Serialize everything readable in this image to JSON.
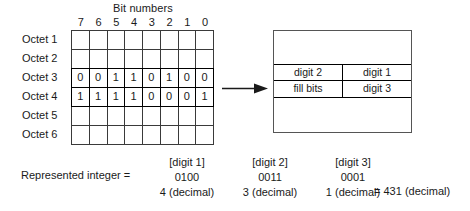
{
  "figure": {
    "bit_numbers": {
      "title": "Bit numbers",
      "labels": [
        "7",
        "6",
        "5",
        "4",
        "3",
        "2",
        "1",
        "0"
      ]
    },
    "octet_rows": [
      {
        "label": "Octet 1",
        "highlight": false,
        "bits": [
          "",
          "",
          "",
          "",
          "",
          "",
          "",
          ""
        ]
      },
      {
        "label": "Octet 2",
        "highlight": false,
        "bits": [
          "",
          "",
          "",
          "",
          "",
          "",
          "",
          ""
        ]
      },
      {
        "label": "Octet 3",
        "highlight": true,
        "bits": [
          "0",
          "0",
          "1",
          "1",
          "0",
          "1",
          "0",
          "0"
        ]
      },
      {
        "label": "Octet 4",
        "highlight": true,
        "bits": [
          "1",
          "1",
          "1",
          "1",
          "0",
          "0",
          "0",
          "1"
        ]
      },
      {
        "label": "Octet 5",
        "highlight": false,
        "bits": [
          "",
          "",
          "",
          "",
          "",
          "",
          "",
          ""
        ]
      },
      {
        "label": "Octet 6",
        "highlight": false,
        "bits": [
          "",
          "",
          "",
          "",
          "",
          "",
          "",
          ""
        ]
      }
    ],
    "arrow": {
      "name": "rightwards-arrow"
    },
    "target_box": {
      "rows": [
        {
          "left": "digit 2",
          "right": "digit 1"
        },
        {
          "left": "fill bits",
          "right": "digit 3"
        }
      ]
    },
    "equation": {
      "label": "Represented integer =",
      "columns": [
        {
          "tag": "[digit 1]",
          "binary": "0100",
          "decimal": "4 (decimal)"
        },
        {
          "tag": "[digit 2]",
          "binary": "0011",
          "decimal": "3 (decimal)"
        },
        {
          "tag": "[digit 3]",
          "binary": "0001",
          "decimal": "1 (decimal)"
        }
      ],
      "result": "= 431 (decimal)"
    }
  },
  "colors": {
    "ink": "#1a1a1a",
    "grid_line": "#3a3a3a",
    "emphasis_line": "#000000",
    "box_line": "#555555",
    "background": "#ffffff"
  }
}
